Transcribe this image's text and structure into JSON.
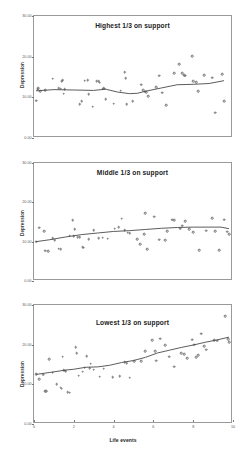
{
  "figure": {
    "background": "#ffffff",
    "marker_color": "#6d6d6d",
    "line_color": "#4a4a4a",
    "frame_color": "#9a9a9a"
  },
  "axis": {
    "xlabel": "Life events",
    "ylabel": "Depression",
    "xticks": [
      "0",
      "2",
      "4",
      "6",
      "8",
      "10"
    ],
    "yticks": [
      "0.00",
      "10.00",
      "20.00",
      "30.00"
    ]
  },
  "chart_data": [
    {
      "type": "scatter",
      "title": "Highest 1/3 on support",
      "xlabel": "",
      "ylabel": "Depression",
      "xlim": [
        0,
        10
      ],
      "ylim": [
        0,
        30
      ],
      "grid": false,
      "legend": "none",
      "xticks": [
        0,
        2,
        4,
        6,
        8,
        10
      ],
      "yticks": [
        0,
        10,
        20,
        30
      ],
      "points": [
        [
          0.1,
          9.2
        ],
        [
          0.18,
          12.0
        ],
        [
          0.22,
          12.2
        ],
        [
          0.3,
          11.5
        ],
        [
          0.55,
          11.8
        ],
        [
          0.95,
          14.6
        ],
        [
          1.25,
          12.2
        ],
        [
          1.35,
          12.1
        ],
        [
          1.4,
          14.0
        ],
        [
          1.45,
          14.2
        ],
        [
          1.5,
          10.9
        ],
        [
          1.55,
          12.0
        ],
        [
          2.3,
          8.3
        ],
        [
          2.4,
          9.0
        ],
        [
          2.55,
          14.1
        ],
        [
          2.7,
          14.2
        ],
        [
          2.75,
          10.7
        ],
        [
          2.95,
          7.7
        ],
        [
          3.15,
          14.0
        ],
        [
          3.25,
          13.9
        ],
        [
          3.3,
          13.6
        ],
        [
          3.45,
          12.1
        ],
        [
          3.5,
          12.2
        ],
        [
          3.55,
          12.1
        ],
        [
          3.6,
          9.5
        ],
        [
          4.0,
          8.4
        ],
        [
          4.35,
          11.6
        ],
        [
          4.55,
          16.2
        ],
        [
          4.6,
          14.7
        ],
        [
          4.65,
          8.3
        ],
        [
          4.95,
          9.0
        ],
        [
          5.4,
          13.1
        ],
        [
          5.5,
          11.8
        ],
        [
          5.6,
          11.4
        ],
        [
          5.65,
          11.2
        ],
        [
          5.75,
          10.3
        ],
        [
          6.15,
          12.5
        ],
        [
          6.3,
          15.3
        ],
        [
          6.45,
          11.1
        ],
        [
          6.65,
          8.1
        ],
        [
          7.05,
          15.9
        ],
        [
          7.3,
          18.1
        ],
        [
          7.45,
          16.0
        ],
        [
          7.55,
          15.4
        ],
        [
          7.6,
          15.3
        ],
        [
          7.95,
          20.1
        ],
        [
          8.0,
          14.0
        ],
        [
          8.15,
          13.7
        ],
        [
          8.25,
          11.5
        ],
        [
          8.55,
          15.4
        ],
        [
          8.95,
          14.8
        ],
        [
          9.1,
          6.2
        ],
        [
          9.45,
          15.7
        ],
        [
          9.55,
          9.1
        ]
      ],
      "trend": [
        [
          0.1,
          11.6
        ],
        [
          1.0,
          11.9
        ],
        [
          2.0,
          11.8
        ],
        [
          3.0,
          11.7
        ],
        [
          3.6,
          12.0
        ],
        [
          4.2,
          11.3
        ],
        [
          4.8,
          10.9
        ],
        [
          5.2,
          11.0
        ],
        [
          5.6,
          11.5
        ],
        [
          6.4,
          12.3
        ],
        [
          7.2,
          13.1
        ],
        [
          8.0,
          13.2
        ],
        [
          8.8,
          13.4
        ],
        [
          9.55,
          14.1
        ]
      ]
    },
    {
      "type": "scatter",
      "title": "Middle 1/3 on support",
      "xlabel": "",
      "ylabel": "Depression",
      "xlim": [
        0,
        10
      ],
      "ylim": [
        0,
        30
      ],
      "grid": false,
      "legend": "none",
      "xticks": [
        0,
        2,
        4,
        6,
        8,
        10
      ],
      "yticks": [
        0,
        10,
        20,
        30
      ],
      "points": [
        [
          0.1,
          10.0
        ],
        [
          0.25,
          13.5
        ],
        [
          0.5,
          12.6
        ],
        [
          0.55,
          7.7
        ],
        [
          0.7,
          7.6
        ],
        [
          0.95,
          10.9
        ],
        [
          1.05,
          10.3
        ],
        [
          1.25,
          8.2
        ],
        [
          1.35,
          8.1
        ],
        [
          1.8,
          11.5
        ],
        [
          1.95,
          15.4
        ],
        [
          2.0,
          11.4
        ],
        [
          2.05,
          13.2
        ],
        [
          2.2,
          11.2
        ],
        [
          2.3,
          11.1
        ],
        [
          2.45,
          8.6
        ],
        [
          2.5,
          8.5
        ],
        [
          2.75,
          10.6
        ],
        [
          3.0,
          12.9
        ],
        [
          3.25,
          10.9
        ],
        [
          3.45,
          11.0
        ],
        [
          3.7,
          10.8
        ],
        [
          4.05,
          13.3
        ],
        [
          4.25,
          13.7
        ],
        [
          4.4,
          15.8
        ],
        [
          4.55,
          12.9
        ],
        [
          4.7,
          12.3
        ],
        [
          4.8,
          12.2
        ],
        [
          5.2,
          10.7
        ],
        [
          5.35,
          9.4
        ],
        [
          5.55,
          11.9
        ],
        [
          5.6,
          17.3
        ],
        [
          5.7,
          8.1
        ],
        [
          6.05,
          16.3
        ],
        [
          6.3,
          10.5
        ],
        [
          6.6,
          10.4
        ],
        [
          6.7,
          12.6
        ],
        [
          6.95,
          15.6
        ],
        [
          7.05,
          15.5
        ],
        [
          7.35,
          13.3
        ],
        [
          7.45,
          14.1
        ],
        [
          7.6,
          15.2
        ],
        [
          7.8,
          13.1
        ],
        [
          8.0,
          12.4
        ],
        [
          8.3,
          7.8
        ],
        [
          8.65,
          12.8
        ],
        [
          8.95,
          15.9
        ],
        [
          9.1,
          12.7
        ],
        [
          9.3,
          7.9
        ],
        [
          9.55,
          15.6
        ],
        [
          9.7,
          12.5
        ],
        [
          9.8,
          11.9
        ]
      ],
      "trend": [
        [
          0.1,
          10.0
        ],
        [
          0.8,
          10.5
        ],
        [
          1.6,
          11.2
        ],
        [
          2.4,
          11.8
        ],
        [
          3.2,
          12.2
        ],
        [
          4.0,
          12.6
        ],
        [
          4.8,
          12.8
        ],
        [
          5.6,
          13.1
        ],
        [
          6.4,
          13.4
        ],
        [
          7.2,
          13.6
        ],
        [
          8.0,
          13.7
        ],
        [
          8.8,
          13.7
        ],
        [
          9.4,
          13.7
        ],
        [
          9.8,
          13.3
        ]
      ]
    },
    {
      "type": "scatter",
      "title": "Lowest 1/3 on support",
      "xlabel": "Life events",
      "ylabel": "Depression",
      "xlim": [
        0,
        10
      ],
      "ylim": [
        0,
        30
      ],
      "grid": false,
      "legend": "none",
      "xticks": [
        0,
        2,
        4,
        6,
        8,
        10
      ],
      "yticks": [
        0,
        10,
        20,
        30
      ],
      "points": [
        [
          0.1,
          12.6
        ],
        [
          0.25,
          11.3
        ],
        [
          0.45,
          12.4
        ],
        [
          0.55,
          8.3
        ],
        [
          0.6,
          8.2
        ],
        [
          0.75,
          16.3
        ],
        [
          0.95,
          12.9
        ],
        [
          1.15,
          10.0
        ],
        [
          1.35,
          9.1
        ],
        [
          1.4,
          8.9
        ],
        [
          1.45,
          17.0
        ],
        [
          1.5,
          13.5
        ],
        [
          1.55,
          13.4
        ],
        [
          1.6,
          13.3
        ],
        [
          1.7,
          8.0
        ],
        [
          1.8,
          7.9
        ],
        [
          2.1,
          19.3
        ],
        [
          2.15,
          17.8
        ],
        [
          2.25,
          12.2
        ],
        [
          2.45,
          13.2
        ],
        [
          2.55,
          14.2
        ],
        [
          2.65,
          17.1
        ],
        [
          2.8,
          14.0
        ],
        [
          2.85,
          15.2
        ],
        [
          3.0,
          13.7
        ],
        [
          3.3,
          11.9
        ],
        [
          3.5,
          13.9
        ],
        [
          3.95,
          11.8
        ],
        [
          4.3,
          12.1
        ],
        [
          4.55,
          15.6
        ],
        [
          4.65,
          15.4
        ],
        [
          4.8,
          11.7
        ],
        [
          5.05,
          15.8
        ],
        [
          5.4,
          15.9
        ],
        [
          5.6,
          18.4
        ],
        [
          5.95,
          21.2
        ],
        [
          6.1,
          18.3
        ],
        [
          6.15,
          16.0
        ],
        [
          6.35,
          21.5
        ],
        [
          6.6,
          19.8
        ],
        [
          6.8,
          17.0
        ],
        [
          7.05,
          14.4
        ],
        [
          7.4,
          17.8
        ],
        [
          7.55,
          17.6
        ],
        [
          7.7,
          16.6
        ],
        [
          7.95,
          21.3
        ],
        [
          8.05,
          20.0
        ],
        [
          8.15,
          16.9
        ],
        [
          8.25,
          17.3
        ],
        [
          8.4,
          22.8
        ],
        [
          8.55,
          19.6
        ],
        [
          8.65,
          18.7
        ],
        [
          9.05,
          21.1
        ],
        [
          9.2,
          21.0
        ],
        [
          9.6,
          27.2
        ],
        [
          9.75,
          21.4
        ],
        [
          9.8,
          20.6
        ]
      ],
      "trend": [
        [
          0.1,
          12.5
        ],
        [
          0.8,
          13.0
        ],
        [
          1.6,
          13.6
        ],
        [
          2.0,
          13.8
        ],
        [
          2.6,
          14.3
        ],
        [
          3.2,
          14.4
        ],
        [
          3.8,
          14.8
        ],
        [
          4.4,
          15.5
        ],
        [
          5.0,
          16.0
        ],
        [
          5.6,
          16.8
        ],
        [
          6.2,
          17.9
        ],
        [
          6.8,
          18.6
        ],
        [
          7.4,
          19.3
        ],
        [
          8.0,
          19.9
        ],
        [
          8.6,
          20.6
        ],
        [
          9.2,
          21.2
        ],
        [
          9.8,
          21.9
        ]
      ]
    }
  ]
}
